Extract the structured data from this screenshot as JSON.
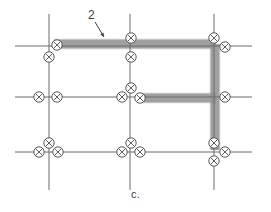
{
  "figure": {
    "caption": "c.",
    "callout_label": "2",
    "width": 271,
    "height": 212,
    "background_color": "#ffffff"
  },
  "colors": {
    "grid_line": "#6b6b6b",
    "highlight_path": "#9a9a9a",
    "highlight_edge": "#7d7d7d",
    "node_stroke": "#4a4a4a",
    "node_fill": "#ffffff",
    "text": "#3c3c3c",
    "caption": "#3a3a3a"
  },
  "grid": {
    "vertical_lines": [
      {
        "name": "vertical-line-left",
        "x": 49,
        "y1": 14,
        "y2": 190
      },
      {
        "name": "vertical-line-middle",
        "x": 130,
        "y1": 14,
        "y2": 190
      },
      {
        "name": "vertical-line-right",
        "x": 214,
        "y1": 14,
        "y2": 190
      }
    ],
    "horizontal_lines": [
      {
        "name": "horizontal-line-top",
        "y": 46,
        "x1": 15,
        "x2": 252
      },
      {
        "name": "horizontal-line-middle",
        "y": 97,
        "x1": 15,
        "x2": 252
      },
      {
        "name": "horizontal-line-bottom",
        "y": 152,
        "x1": 15,
        "x2": 252
      }
    ]
  },
  "highlight": {
    "name": "highlighted-path-2",
    "thickness": 9,
    "segments": [
      {
        "name": "highlight-top-horizontal",
        "x1": 54,
        "y1": 44,
        "x2": 216,
        "y2": 44
      },
      {
        "name": "highlight-right-vertical",
        "x1": 215,
        "y1": 44,
        "x2": 215,
        "y2": 150
      },
      {
        "name": "highlight-middle-horizontal",
        "x1": 141,
        "y1": 98,
        "x2": 216,
        "y2": 98
      }
    ]
  },
  "callout": {
    "name": "callout-2",
    "label": "2",
    "label_x": 88,
    "label_y": 8,
    "arrow_from": {
      "x": 95,
      "y": 22
    },
    "arrow_to": {
      "x": 104,
      "y": 37
    }
  },
  "nodes": [
    {
      "name": "node-top-left-on-line",
      "x": 57,
      "y": 45
    },
    {
      "name": "node-top-left-below",
      "x": 49,
      "y": 57
    },
    {
      "name": "node-top-middle-above",
      "x": 131,
      "y": 38
    },
    {
      "name": "node-top-middle-below",
      "x": 131,
      "y": 57
    },
    {
      "name": "node-top-right-above",
      "x": 214,
      "y": 38
    },
    {
      "name": "node-top-right-side",
      "x": 225,
      "y": 47
    },
    {
      "name": "node-mid-left-west",
      "x": 39,
      "y": 97
    },
    {
      "name": "node-mid-left-east",
      "x": 57,
      "y": 97
    },
    {
      "name": "node-mid-middle-west",
      "x": 122,
      "y": 97
    },
    {
      "name": "node-mid-middle-above",
      "x": 131,
      "y": 88
    },
    {
      "name": "node-mid-middle-east",
      "x": 140,
      "y": 98
    },
    {
      "name": "node-mid-right-side",
      "x": 225,
      "y": 97
    },
    {
      "name": "node-bottom-left-above",
      "x": 49,
      "y": 143
    },
    {
      "name": "node-bottom-left-west",
      "x": 39,
      "y": 152
    },
    {
      "name": "node-bottom-left-east",
      "x": 58,
      "y": 152
    },
    {
      "name": "node-bottom-middle-above",
      "x": 131,
      "y": 143
    },
    {
      "name": "node-bottom-middle-west",
      "x": 122,
      "y": 152
    },
    {
      "name": "node-bottom-middle-east",
      "x": 140,
      "y": 152
    },
    {
      "name": "node-bottom-right-above",
      "x": 214,
      "y": 143
    },
    {
      "name": "node-bottom-right-below",
      "x": 214,
      "y": 161
    },
    {
      "name": "node-bottom-right-east",
      "x": 225,
      "y": 152
    }
  ],
  "node_style": {
    "radius": 5.2,
    "cross_arm": 3.5,
    "stroke_width": 0.9
  }
}
